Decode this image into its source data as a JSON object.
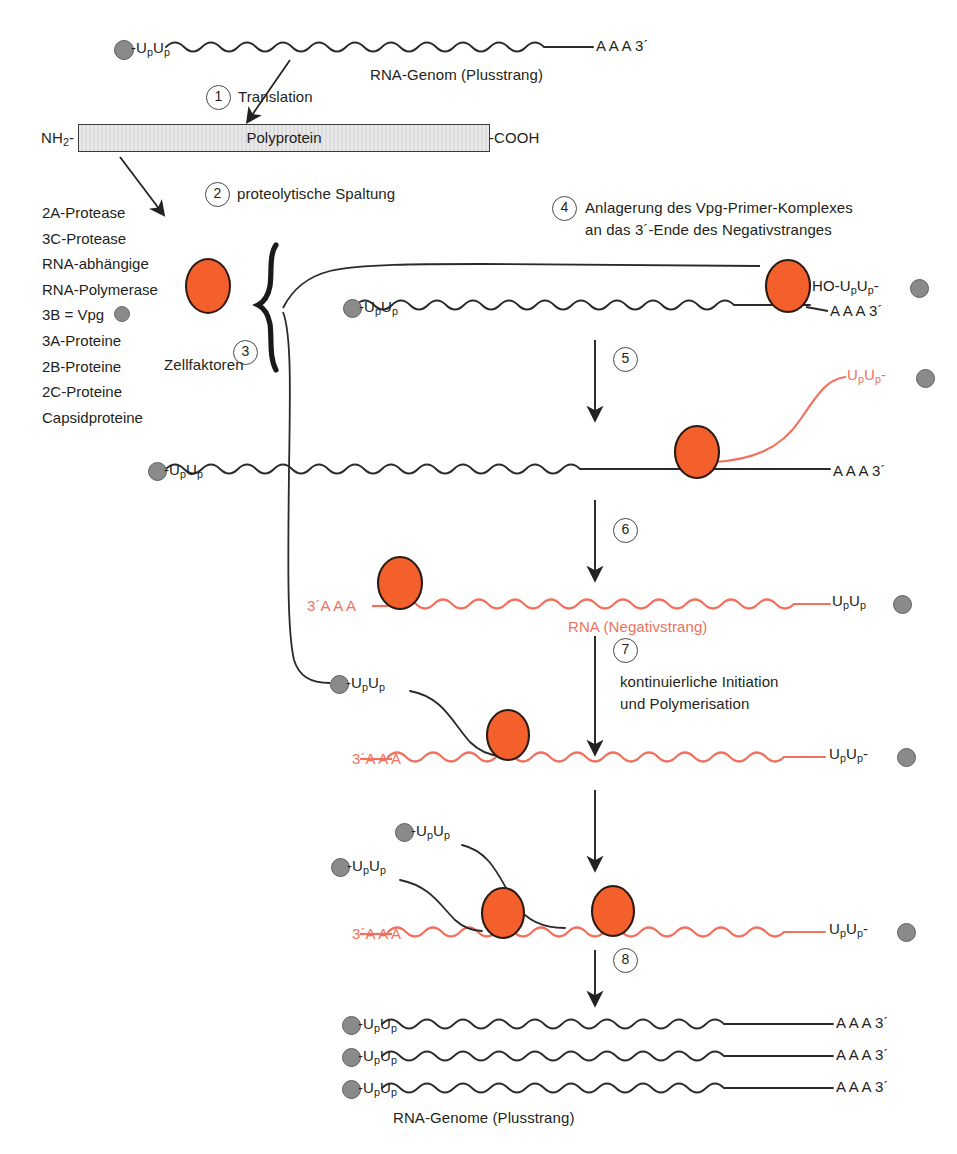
{
  "diagram": {
    "colors": {
      "orange": "#F4602B",
      "salmon": "#F2705E",
      "gray": "#8a8a8a",
      "ink": "#231f20",
      "faint_gray": "#b9b9b9"
    }
  },
  "top_genome": {
    "five_prime": "-U U",
    "five_prime_subs": "p p",
    "three_prime": "A A A 3´",
    "caption": "RNA-Genom (Plusstrang)"
  },
  "steps": {
    "s1": {
      "num": "1",
      "label": "Translation"
    },
    "s2": {
      "num": "2",
      "label": "proteolytische Spaltung"
    },
    "s3": {
      "num": "3",
      "label": "Zellfaktoren"
    },
    "s4": {
      "num": "4",
      "label_line1": "Anlagerung des Vpg-Primer-Komplexes",
      "label_line2": "an das 3´-Ende des Negativstranges"
    },
    "s5": {
      "num": "5",
      "label": ""
    },
    "s6": {
      "num": "6",
      "label": ""
    },
    "s7": {
      "num": "7",
      "label_line1": "kontinuierliche Initiation",
      "label_line2": "und Polymerisation"
    },
    "s8": {
      "num": "8",
      "label": ""
    }
  },
  "polyprotein": {
    "n_terminus": "NH",
    "n_terminus_sub": "2",
    "n_terminus_tail": "-",
    "label": "Polyprotein",
    "c_terminus": "-COOH"
  },
  "protein_list": [
    {
      "text": "2A-Protease",
      "color": "ink"
    },
    {
      "text": "3C-Protease",
      "color": "ink"
    },
    {
      "text": "RNA-abhängige",
      "color": "salmon"
    },
    {
      "text": "RNA-Polymerase",
      "color": "salmon"
    },
    {
      "text": "3B = Vpg",
      "color": "faint",
      "has_dot": true
    },
    {
      "text": "3A-Proteine",
      "color": "ink"
    },
    {
      "text": "2B-Proteine",
      "color": "ink"
    },
    {
      "text": "2C-Proteine",
      "color": "ink"
    },
    {
      "text": "Capsidproteine",
      "color": "ink"
    }
  ],
  "panel4": {
    "five_prime": "-U U",
    "three_prime": "A A A 3´",
    "primer_label": "HO-U U",
    "primer_tail": "-"
  },
  "panel5": {
    "five_prime": "-U U",
    "three_prime": "A A A 3´",
    "nascent_label": "U U",
    "nascent_tail": "-"
  },
  "panel6": {
    "three_prime_left": "3´A A A",
    "caption": "RNA (Negativstrang)",
    "right_label": "U U"
  },
  "panel7": {
    "primer_label": "-U U",
    "three_prime_left": "3´A A A",
    "right_label": "U U",
    "right_tail": "-"
  },
  "panel8": {
    "primer_label_upper": "-U U",
    "primer_label_lower": "-U U",
    "three_prime_left": "3´A A A",
    "right_label": "U U",
    "right_tail": "-"
  },
  "output_genomes": {
    "strands": [
      {
        "five_prime": "-U U",
        "three_prime": "A A A 3´"
      },
      {
        "five_prime": "-U U",
        "three_prime": "A A A 3´"
      },
      {
        "five_prime": "-U U",
        "three_prime": "A A A 3´"
      }
    ],
    "caption": "RNA-Genome (Plusstrang)"
  }
}
